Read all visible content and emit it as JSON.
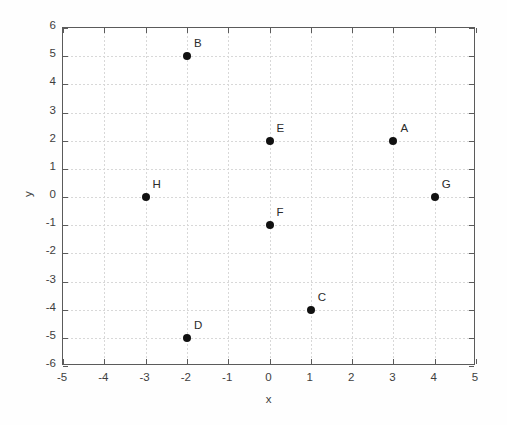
{
  "chart_data": {
    "type": "scatter",
    "title": "",
    "xlabel": "x",
    "ylabel": "y",
    "xlim": [
      -5,
      5
    ],
    "ylim": [
      -6,
      6
    ],
    "xticks": [
      "-5",
      "-4",
      "-3",
      "-2",
      "-1",
      "0",
      "1",
      "2",
      "3",
      "4",
      "5"
    ],
    "xtick_values": [
      -5,
      -4,
      -3,
      -2,
      -1,
      0,
      1,
      2,
      3,
      4,
      5
    ],
    "yticks": [
      "6",
      "5",
      "4",
      "3",
      "2",
      "1",
      "0",
      "-1",
      "-2",
      "-3",
      "-4",
      "-5",
      "-6"
    ],
    "ytick_values": [
      6,
      5,
      4,
      3,
      2,
      1,
      0,
      -1,
      -2,
      -3,
      -4,
      -5,
      -6
    ],
    "grid": true,
    "legend": null,
    "marker": "filled-circle",
    "marker_color": "#111111",
    "points": [
      {
        "label": "A",
        "x": 3,
        "y": 2
      },
      {
        "label": "B",
        "x": -2,
        "y": 5
      },
      {
        "label": "C",
        "x": 1,
        "y": -4
      },
      {
        "label": "D",
        "x": -2,
        "y": -5
      },
      {
        "label": "E",
        "x": 0,
        "y": 2
      },
      {
        "label": "F",
        "x": 0,
        "y": -1
      },
      {
        "label": "G",
        "x": 4,
        "y": 0
      },
      {
        "label": "H",
        "x": -3,
        "y": 0
      }
    ]
  },
  "colors": {
    "axis": "#5b5b5b",
    "grid": "#d8d8d8",
    "text": "#3d3d3d",
    "marker": "#111111",
    "background": "#ffffff"
  }
}
